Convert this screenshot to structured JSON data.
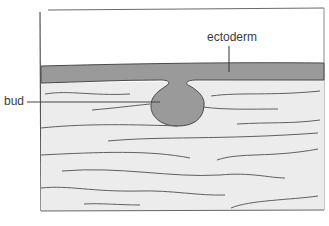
{
  "diagram": {
    "type": "biological cross-section",
    "labels": {
      "ectoderm": "ectoderm",
      "bud": "bud"
    },
    "regions": [
      {
        "name": "ectoderm",
        "description": "dark gray epithelial band across the top of the tissue"
      },
      {
        "name": "bud",
        "description": "rounded outgrowth of ectoderm invaginating into the mesenchyme"
      },
      {
        "name": "mesenchyme",
        "description": "light gray tissue with wavy fibre lines below the ectoderm"
      }
    ],
    "colors": {
      "ectoderm_fill": "#9a9a9a",
      "mesenchyme_fill": "#ececec",
      "outline": "#555555",
      "background": "#ffffff"
    }
  }
}
